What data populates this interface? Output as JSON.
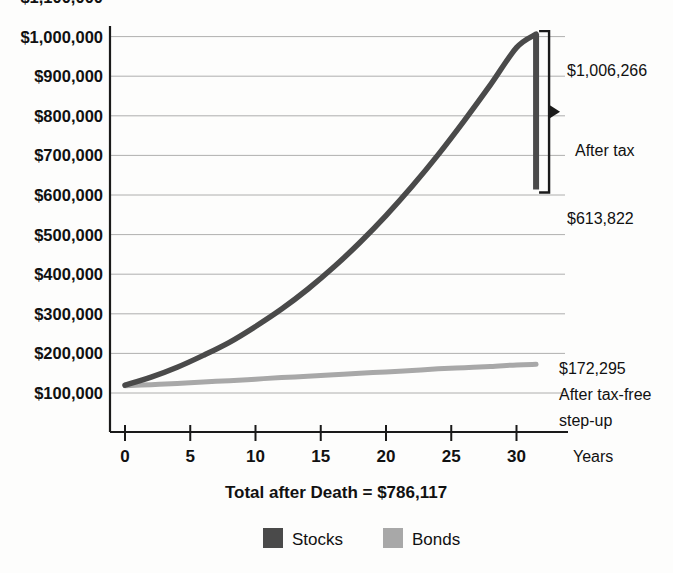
{
  "chart_data": {
    "type": "line",
    "title": "Total after Death = $786,117",
    "xlabel": "Years",
    "ylabel": "",
    "grid": true,
    "legend_position": "bottom",
    "xlim": [
      0,
      33
    ],
    "ylim": [
      0,
      1100000
    ],
    "x_ticks": [
      0,
      5,
      10,
      15,
      20,
      25,
      30
    ],
    "x_tick_labels": [
      "0",
      "5",
      "10",
      "15",
      "20",
      "25",
      "30"
    ],
    "y_ticks": [
      100000,
      200000,
      300000,
      400000,
      500000,
      600000,
      700000,
      800000,
      900000,
      1000000,
      1100000
    ],
    "y_tick_labels": [
      "$100,000",
      "$200,000",
      "$300,000",
      "$400,000",
      "$500,000",
      "$600,000",
      "$700,000",
      "$800,000",
      "$900,000",
      "$1,000,000",
      "$1,100,000"
    ],
    "x": [
      0,
      2,
      4,
      6,
      8,
      10,
      12,
      14,
      16,
      18,
      20,
      22,
      24,
      26,
      28,
      30,
      31.5
    ],
    "series": [
      {
        "name": "Stocks",
        "color": "#4a4a4a",
        "values": [
          120000,
          140000,
          165000,
          195000,
          228000,
          268000,
          312000,
          362000,
          418000,
          480000,
          548000,
          622000,
          702000,
          788000,
          878000,
          972000,
          1006266
        ]
      },
      {
        "name": "Bonds",
        "color": "#a8a8a8",
        "values": [
          118000,
          121000,
          124000,
          128000,
          131000,
          135000,
          139000,
          142000,
          146000,
          150000,
          153000,
          157000,
          161000,
          164000,
          167000,
          171000,
          172295
        ]
      }
    ],
    "legend": [
      {
        "label": "Stocks",
        "color": "#4a4a4a"
      },
      {
        "label": "Bonds",
        "color": "#a8a8a8"
      }
    ],
    "annotations": {
      "stocks_peak_value": "$1,006,266",
      "stocks_after_tax_value": "$613,822",
      "after_tax_label": "After tax",
      "bonds_end_value": "$172,295",
      "bonds_note_line1": "After tax-free",
      "bonds_note_line2": "step-up"
    },
    "drop_marker": {
      "top_value": 1006266,
      "bottom_value": 613822,
      "at_x": 31.5
    }
  }
}
